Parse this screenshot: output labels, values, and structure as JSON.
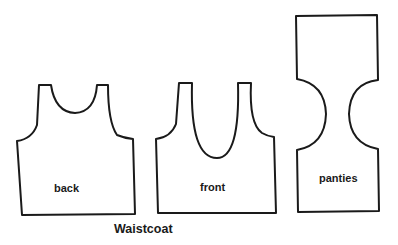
{
  "title": "Waistcoat",
  "pieces": [
    {
      "id": "back",
      "label": "back"
    },
    {
      "id": "front",
      "label": "front"
    },
    {
      "id": "panties",
      "label": "panties"
    }
  ],
  "colors": {
    "line": "#1a1a1a",
    "background": "#ffffff"
  }
}
